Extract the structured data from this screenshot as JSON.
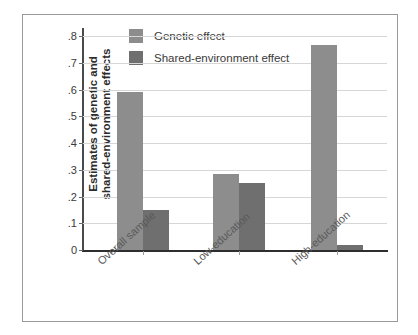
{
  "chart_data": {
    "type": "bar",
    "title": "",
    "xlabel": "",
    "ylabel": "Estimates of genetic and\nshared-environment effects",
    "categories": [
      "Overall sample",
      "Low-education",
      "High-education"
    ],
    "series": [
      {
        "name": "Genetic effect",
        "color": "#8d8d8d",
        "values": [
          0.59,
          0.285,
          0.765
        ]
      },
      {
        "name": "Shared-environment effect",
        "color": "#6f6f6f",
        "values": [
          0.15,
          0.25,
          0.02
        ]
      }
    ],
    "ylim": [
      0,
      0.8
    ],
    "ytick_labels": [
      "0",
      ".1",
      ".2",
      ".3",
      ".4",
      ".5",
      ".6",
      ".7",
      ".8"
    ],
    "ytick_values": [
      0,
      0.1,
      0.2,
      0.3,
      0.4,
      0.5,
      0.6,
      0.7,
      0.8
    ],
    "grid": true,
    "legend_position": "upper-center"
  },
  "figure": {
    "border_color": "#9a9a9a",
    "background": "#ffffff",
    "axis_color": "#2e2e2e",
    "gridline_color": "#d6d6d6"
  }
}
